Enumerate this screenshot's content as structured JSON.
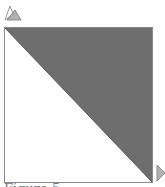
{
  "diagram": {
    "shape": "square-split-diagonal",
    "fill_region": "upper-right-triangle",
    "colors": {
      "fill": "#6e6e6e",
      "border": "#8a8a8a",
      "background": "#ffffff",
      "marker": "#b3b3b3"
    },
    "markers": [
      {
        "name": "top-left-marker",
        "shape": "up-pointing-triangles"
      },
      {
        "name": "bottom-right-marker",
        "shape": "right-pointing-triangle"
      }
    ]
  },
  "caption": {
    "text": "Figure 5"
  }
}
